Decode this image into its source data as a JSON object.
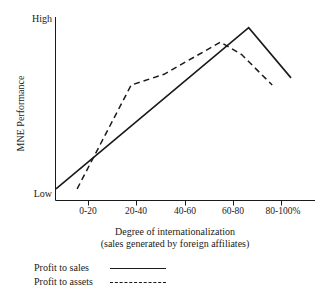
{
  "chart_data": {
    "type": "line",
    "title": "",
    "subtitle": "",
    "xlabel": "Degree of internationalization",
    "xlabel_sub": "(sales generated by foreign affiliates)",
    "ylabel": "MNE Performance",
    "x_tick_labels": [
      "0-20",
      "20-40",
      "40-60",
      "60-80",
      "80-100%"
    ],
    "y_tick_labels": [
      "High",
      "Low"
    ],
    "ylim_labels": {
      "low": "Low",
      "high": "High"
    },
    "grid": false,
    "legend_position": "below-left",
    "axis_color": "#1a1a1a",
    "line_color": "#1a1a1a",
    "background_color": "#ffffff",
    "series": [
      {
        "name": "Profit to sales",
        "style": "solid",
        "points": [
          {
            "x": 0.0,
            "y": 0.04
          },
          {
            "x": 0.82,
            "y": 0.94
          },
          {
            "x": 1.0,
            "y": 0.66
          }
        ]
      },
      {
        "name": "Profit to assets",
        "style": "dashed",
        "points": [
          {
            "x": 0.09,
            "y": 0.04
          },
          {
            "x": 0.32,
            "y": 0.62
          },
          {
            "x": 0.46,
            "y": 0.68
          },
          {
            "x": 0.7,
            "y": 0.86
          },
          {
            "x": 0.79,
            "y": 0.79
          },
          {
            "x": 0.92,
            "y": 0.62
          }
        ]
      }
    ],
    "annotations": []
  },
  "legend": {
    "items": [
      {
        "label": "Profit to sales",
        "style": "solid"
      },
      {
        "label": "Profit to assets",
        "style": "dashed"
      }
    ]
  }
}
